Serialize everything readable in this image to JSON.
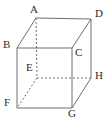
{
  "figure": {
    "kind": "geometry-diagram",
    "shape_name": "cube",
    "canvas": {
      "width": 111,
      "height": 119
    },
    "background_color": "#ffffff",
    "line_color": "#6e6e6e",
    "label_color": "#2b2b2b",
    "stroke_width": 1,
    "dash_pattern": "2 2"
  },
  "vertices": [
    {
      "id": "A",
      "label": "A",
      "x": 36,
      "y": 18,
      "label_x": 30,
      "label_y": 4,
      "hidden": false
    },
    {
      "id": "D",
      "label": "D",
      "x": 91,
      "y": 19,
      "label_x": 95,
      "label_y": 8,
      "hidden": false
    },
    {
      "id": "B",
      "label": "B",
      "x": 17,
      "y": 48,
      "label_x": 3,
      "label_y": 39,
      "hidden": false
    },
    {
      "id": "C",
      "label": "C",
      "x": 72,
      "y": 48,
      "label_x": 75,
      "label_y": 47,
      "hidden": false
    },
    {
      "id": "E",
      "label": "E",
      "x": 37,
      "y": 78,
      "label_x": 26,
      "label_y": 62,
      "hidden": true
    },
    {
      "id": "H",
      "label": "H",
      "x": 91,
      "y": 78,
      "label_x": 95,
      "label_y": 70,
      "hidden": false
    },
    {
      "id": "F",
      "label": "F",
      "x": 17,
      "y": 108,
      "label_x": 4,
      "label_y": 97,
      "hidden": false
    },
    {
      "id": "G",
      "label": "G",
      "x": 72,
      "y": 108,
      "label_x": 68,
      "label_y": 108,
      "hidden": false
    }
  ],
  "edges": [
    {
      "id": "AB",
      "from": "A",
      "to": "B",
      "style": "solid",
      "x1": 36,
      "y1": 18,
      "x2": 17,
      "y2": 48
    },
    {
      "id": "AD",
      "from": "A",
      "to": "D",
      "style": "solid",
      "x1": 36,
      "y1": 18,
      "x2": 91,
      "y2": 19
    },
    {
      "id": "DC",
      "from": "D",
      "to": "C",
      "style": "solid",
      "x1": 91,
      "y1": 19,
      "x2": 72,
      "y2": 48
    },
    {
      "id": "DH",
      "from": "D",
      "to": "H",
      "style": "solid",
      "x1": 91,
      "y1": 19,
      "x2": 91,
      "y2": 78
    },
    {
      "id": "BC",
      "from": "B",
      "to": "C",
      "style": "solid",
      "x1": 17,
      "y1": 48,
      "x2": 72,
      "y2": 48
    },
    {
      "id": "BF",
      "from": "B",
      "to": "F",
      "style": "solid",
      "x1": 17,
      "y1": 48,
      "x2": 17,
      "y2": 108
    },
    {
      "id": "CG",
      "from": "C",
      "to": "G",
      "style": "solid",
      "x1": 72,
      "y1": 48,
      "x2": 72,
      "y2": 108
    },
    {
      "id": "FG",
      "from": "F",
      "to": "G",
      "style": "solid",
      "x1": 17,
      "y1": 108,
      "x2": 72,
      "y2": 108
    },
    {
      "id": "GH",
      "from": "G",
      "to": "H",
      "style": "solid",
      "x1": 72,
      "y1": 108,
      "x2": 91,
      "y2": 78
    },
    {
      "id": "AE",
      "from": "A",
      "to": "E",
      "style": "dashed",
      "x1": 36,
      "y1": 18,
      "x2": 37,
      "y2": 78
    },
    {
      "id": "EH",
      "from": "E",
      "to": "H",
      "style": "dashed",
      "x1": 37,
      "y1": 78,
      "x2": 91,
      "y2": 78
    },
    {
      "id": "EF",
      "from": "E",
      "to": "F",
      "style": "dashed",
      "x1": 37,
      "y1": 78,
      "x2": 17,
      "y2": 108
    }
  ]
}
